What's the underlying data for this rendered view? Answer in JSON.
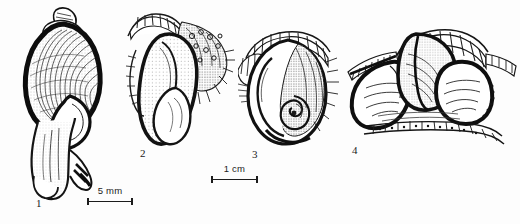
{
  "plate": {
    "title": "Gastropod shell and soft-body anatomy plate",
    "background_color": "#fdfdfd",
    "ink_color": "#1a1a1a",
    "width": 520,
    "height": 224,
    "style": "pen-and-ink stipple line drawing"
  },
  "figures": [
    {
      "number": "1",
      "name": "whole-snail-shell-with-extended-foot",
      "caption": "Whole shell, apertural view, with extended foot and siphon",
      "label_x": 36,
      "label_y": 203
    },
    {
      "number": "2",
      "name": "dissection-lateral-view",
      "caption": "Dissected soft parts, lateral view with stippled mantle",
      "label_x": 140,
      "label_y": 152
    },
    {
      "number": "3",
      "name": "dissection-coiled-visceral-mass",
      "caption": "Dissected soft parts showing coiled visceral mass",
      "label_x": 252,
      "label_y": 153
    },
    {
      "number": "4",
      "name": "dissection-paired-lobes-view",
      "caption": "Dissected soft parts, paired lobes with ridged margin",
      "label_x": 352,
      "label_y": 149
    }
  ],
  "scalebars": [
    {
      "name": "scalebar-5mm",
      "label": "5 mm",
      "x": 87,
      "y": 186,
      "length": 46,
      "applies_to": "1"
    },
    {
      "name": "scalebar-1cm",
      "label": "1 cm",
      "x": 211,
      "y": 164,
      "length": 47,
      "applies_to": "2, 3, 4"
    }
  ]
}
